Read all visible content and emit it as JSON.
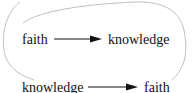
{
  "diagram": {
    "rows": [
      {
        "from": "faith",
        "to": "knowledge"
      },
      {
        "from": "knowledge",
        "to": "faith"
      }
    ],
    "colors": {
      "text": "#111111",
      "arrow": "#111111",
      "loop": "#b0b0b0"
    }
  }
}
